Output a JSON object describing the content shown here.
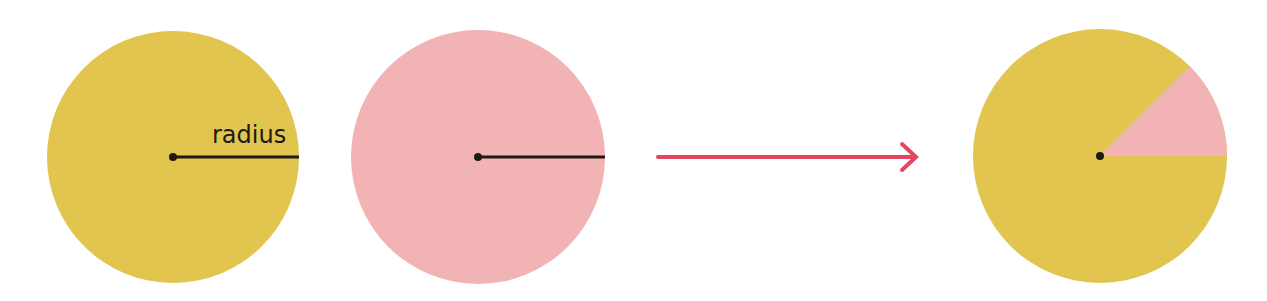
{
  "diagram": {
    "colors": {
      "gold": "#e1c54e",
      "pink": "#f2b3b4",
      "line": "#1d1a14",
      "arrow": "#e4455f",
      "background": "#ffffff"
    },
    "circle1": {
      "fill": "gold",
      "label": "radius",
      "cx": 173,
      "cy": 157,
      "r": 126
    },
    "circle2": {
      "fill": "pink",
      "cx": 478,
      "cy": 157,
      "r": 127
    },
    "arrow": {
      "x1": 658,
      "x2": 917,
      "y": 157
    },
    "circle3": {
      "fill": "gold",
      "sector_fill": "pink",
      "cx": 1100,
      "cy": 156,
      "r": 127,
      "sector_angle_deg": 45
    }
  }
}
